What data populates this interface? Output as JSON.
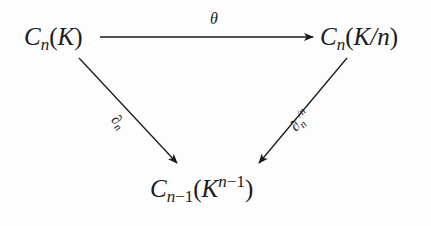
{
  "diagram": {
    "type": "commutative-triangle",
    "nodes": {
      "top_left": {
        "base": "C",
        "sub": "n",
        "open": "(",
        "arg": "K",
        "close": ")"
      },
      "top_right": {
        "base": "C",
        "sub": "n",
        "open": "(",
        "arg": "K/n",
        "close": ")"
      },
      "bottom": {
        "base": "C",
        "sub_var": "n",
        "sub_rest": "−1",
        "open": "(",
        "arg": "K",
        "sup_var": "n",
        "sup_rest": "−1",
        "close": ")"
      }
    },
    "arrows": {
      "top": {
        "from": "top_left",
        "to": "top_right",
        "label": "θ"
      },
      "left": {
        "from": "top_left",
        "to": "bottom",
        "label_base": "∂",
        "label_sub": "n"
      },
      "right": {
        "from": "top_right",
        "to": "bottom",
        "label_base": "∂",
        "label_sub": "n",
        "label_sup": "/n"
      }
    },
    "colors": {
      "stroke": "#1a1a1a",
      "background": "#fdfdfd"
    }
  }
}
